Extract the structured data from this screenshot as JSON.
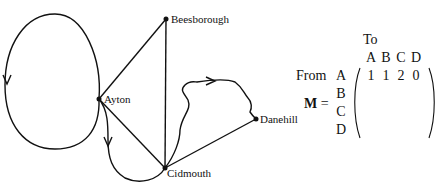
{
  "graph": {
    "nodes": [
      {
        "id": "A",
        "label": "Ayton",
        "x": 99,
        "y": 99
      },
      {
        "id": "B",
        "label": "Beesborough",
        "x": 166,
        "y": 19
      },
      {
        "id": "C",
        "label": "Cidmouth",
        "x": 165,
        "y": 168
      },
      {
        "id": "D",
        "label": "Danehill",
        "x": 256,
        "y": 119
      }
    ],
    "edges": [
      {
        "from": "A",
        "to": "A",
        "type": "directed loop"
      },
      {
        "from": "A",
        "to": "B",
        "type": "undirected"
      },
      {
        "from": "A",
        "to": "C",
        "type": "undirected"
      },
      {
        "from": "A",
        "to": "C",
        "type": "directed curve"
      },
      {
        "from": "B",
        "to": "C",
        "type": "undirected"
      },
      {
        "from": "C",
        "to": "D",
        "type": "undirected"
      },
      {
        "from": "C",
        "to": "D",
        "type": "directed curve"
      }
    ],
    "colors": {
      "line": "#111111",
      "node": "#111111"
    }
  },
  "matrix": {
    "name": "M",
    "equals": "=",
    "to_label": "To",
    "from_label": "From",
    "col_headers": [
      "A",
      "B",
      "C",
      "D"
    ],
    "row_headers": [
      "A",
      "B",
      "C",
      "D"
    ],
    "rows": [
      [
        "1",
        "1",
        "2",
        "0"
      ],
      [
        "",
        "",
        "",
        ""
      ],
      [
        "",
        "",
        "",
        ""
      ],
      [
        "",
        "",
        "",
        ""
      ]
    ]
  }
}
